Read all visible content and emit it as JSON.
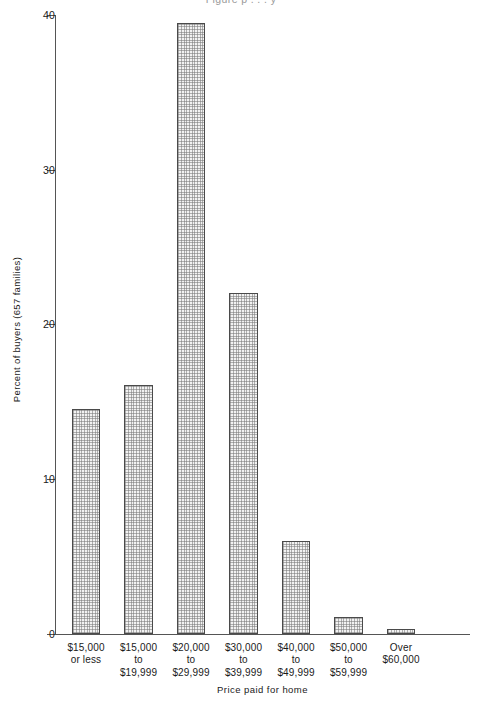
{
  "figure": {
    "clipped_top_title": "Figure   p       . . .   y"
  },
  "chart_data": {
    "type": "bar",
    "title": "",
    "xlabel": "Price paid for home",
    "ylabel": "Percent of buyers (657 families)",
    "categories": [
      "$15,000\nor less",
      "$15,000\nto\n$19,999",
      "$20,000\nto\n$29,999",
      "$30,000\nto\n$39,999",
      "$40,000\nto\n$49,999",
      "$50,000\nto\n$59,999",
      "Over\n$60,000"
    ],
    "values": [
      14.5,
      16.1,
      39.5,
      22.0,
      6.0,
      1.1,
      0.3
    ],
    "ylim": [
      0,
      40
    ],
    "yticks": [
      0,
      10,
      20,
      30,
      40
    ],
    "ytick_labels": [
      "0",
      "10",
      "20",
      "30",
      "40"
    ],
    "grid": false,
    "legend": false,
    "bar_fill": "#f2f2f2",
    "bar_edge": "#4a4a4a",
    "axis_color": "#555555",
    "total_families": 657
  }
}
